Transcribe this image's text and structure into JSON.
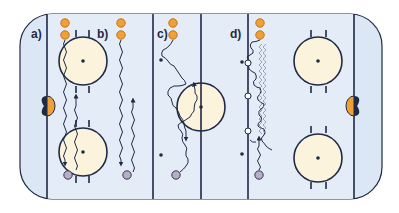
{
  "diagram": {
    "type": "ice-hockey-drill",
    "colors": {
      "ice": "#dbe7f4",
      "ice_light": "#e6eef8",
      "lines": "#1f2a44",
      "faceoff_fill": "#fbf3dc",
      "player_attacker": "#f0a035",
      "player_attacker_stroke": "#c47410",
      "player_defender": "#b7aecb",
      "player_defender_stroke": "#3a3550",
      "cone": "#ffffff",
      "goal_orange": "#f0a035",
      "goal_dark": "#1f2a44"
    },
    "drills": [
      {
        "id": "a",
        "label": "a)"
      },
      {
        "id": "b",
        "label": "b)"
      },
      {
        "id": "c",
        "label": "c)"
      },
      {
        "id": "d",
        "label": "d)"
      }
    ]
  }
}
